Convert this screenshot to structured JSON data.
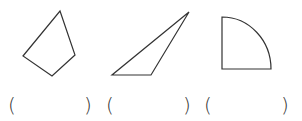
{
  "figures": [
    {
      "name": "quadrilateral",
      "points": "60,11 75,55 52,76 23,56"
    },
    {
      "name": "obtuse-triangle",
      "points": "189,12 112,75 151,75"
    },
    {
      "name": "quarter-circle",
      "path": "M222,17 L222,69 L271,69 A49,52 0 0 0 222,17 Z"
    }
  ],
  "answer_blanks": [
    {
      "open": "(",
      "close": ")"
    },
    {
      "open": "(",
      "close": ")"
    },
    {
      "open": "(",
      "close": ")"
    }
  ],
  "colors": {
    "stroke": "#333333",
    "background": "#ffffff"
  }
}
